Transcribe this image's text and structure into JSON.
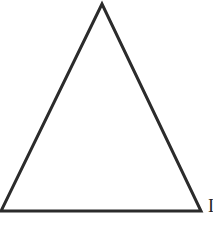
{
  "diagram": {
    "type": "triangle",
    "shape": "isosceles",
    "stroke_color": "#2b2b2b",
    "fill_color": "#ffffff",
    "stroke_width": 3,
    "vertices": {
      "apex": [
        102,
        4
      ],
      "bottom_left": [
        1,
        211
      ],
      "bottom_right": [
        201,
        211
      ]
    },
    "labels": {
      "bottom_right_partial": "I"
    }
  }
}
